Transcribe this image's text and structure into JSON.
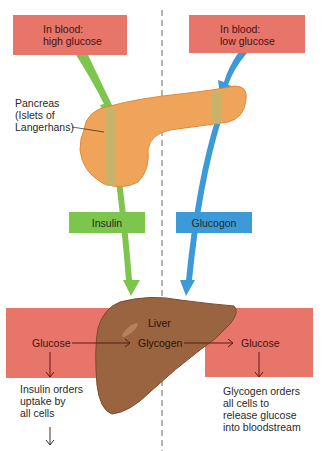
{
  "top_boxes": {
    "left": {
      "line1": "In blood:",
      "line2": "high glucose"
    },
    "right": {
      "line1": "In blood:",
      "line2": "low glucose"
    }
  },
  "pancreas": {
    "line1": "Pancreas",
    "line2": "(Islets of",
    "line3": "Langerhans)"
  },
  "hormones": {
    "insulin": "Insulin",
    "glucagon": "Glucogon"
  },
  "liver": {
    "name": "Liver",
    "glucose_in": "Glucose",
    "glycogen": "Glycogen",
    "glucose_out": "Glucose"
  },
  "outcomes": {
    "left": {
      "line1": "Insulin orders",
      "line2": "uptake by",
      "line3": "all cells"
    },
    "right": {
      "line1": "Glycogen orders",
      "line2": "all cells to",
      "line3": "release glucose",
      "line4": "into bloodstream"
    }
  },
  "colors": {
    "red_box": "#e8756a",
    "insulin_green": "#7cc64e",
    "glucagon_blue": "#3d9ad8",
    "pancreas_orange": "#f0a45a",
    "liver_brown": "#9a6440",
    "arrow_dark_red": "#5a1a12"
  }
}
